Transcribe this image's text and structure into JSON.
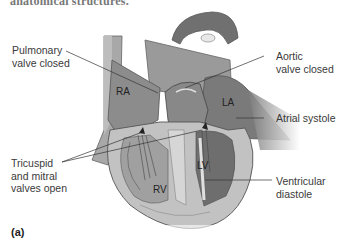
{
  "figure": {
    "caption_fragment": "anatomical structures.",
    "panel_label": "(a)",
    "colors": {
      "wall": "#b9b9b9",
      "chamber": "#8a8a8a",
      "dark_chamber": "#6a6a6a",
      "muscle": "#c9c9c9",
      "outline": "#555555",
      "leader_line": "#333333",
      "text": "#3a3a3a"
    },
    "callouts": {
      "pulmonary": {
        "line1": "Pulmonary",
        "line2": "valve closed"
      },
      "aortic": {
        "line1": "Aortic",
        "line2": "valve closed"
      },
      "atrial": {
        "line1": "Atrial systole"
      },
      "tricuspid": {
        "line1": "Tricuspid",
        "line2": "and mitral",
        "line3": "valves open"
      },
      "ventricular": {
        "line1": "Ventricular",
        "line2": "diastole"
      }
    },
    "chambers": {
      "ra": "RA",
      "la": "LA",
      "rv": "RV",
      "lv": "LV"
    }
  }
}
